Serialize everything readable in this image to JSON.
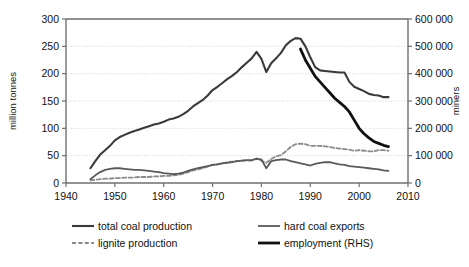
{
  "chart_data": {
    "type": "line",
    "title": "",
    "xlabel": "",
    "ylabel": "million tonnes",
    "y2label": "miners",
    "xlim": [
      1940,
      2010
    ],
    "ylim": [
      0,
      300
    ],
    "y2lim": [
      0,
      600000
    ],
    "xticks": [
      1940,
      1950,
      1960,
      1970,
      1980,
      1990,
      2000,
      2010
    ],
    "xticklabels": [
      "1940",
      "1950",
      "1960",
      "1970",
      "1980",
      "1990",
      "2000",
      "2010"
    ],
    "yticks": [
      0,
      50,
      100,
      150,
      200,
      250,
      300
    ],
    "yticklabels": [
      "0",
      "50",
      "100",
      "150",
      "200",
      "250",
      "300"
    ],
    "y2ticks": [
      0,
      100000,
      200000,
      300000,
      400000,
      500000,
      600000
    ],
    "y2ticklabels": [
      "0",
      "100 000",
      "200 000",
      "300 000",
      "400 000",
      "500 000",
      "600 000"
    ],
    "grid": true,
    "grid_axis": "y",
    "legend_position": "below",
    "series": [
      {
        "name": "total coal production",
        "axis": "left",
        "style": "solid",
        "color": "#3a3a3a",
        "width": 2.1,
        "x": [
          1945,
          1946,
          1947,
          1948,
          1949,
          1950,
          1951,
          1952,
          1953,
          1954,
          1955,
          1956,
          1957,
          1958,
          1959,
          1960,
          1961,
          1962,
          1963,
          1964,
          1965,
          1966,
          1967,
          1968,
          1969,
          1970,
          1971,
          1972,
          1973,
          1974,
          1975,
          1976,
          1977,
          1978,
          1979,
          1980,
          1981,
          1982,
          1983,
          1984,
          1985,
          1986,
          1987,
          1988,
          1989,
          1990,
          1991,
          1992,
          1993,
          1994,
          1995,
          1996,
          1997,
          1998,
          1999,
          2000,
          2001,
          2002,
          2003,
          2004,
          2005,
          2006
        ],
        "y": [
          27,
          40,
          52,
          60,
          68,
          78,
          84,
          88,
          92,
          95,
          98,
          101,
          104,
          107,
          109,
          112,
          116,
          118,
          121,
          126,
          132,
          140,
          146,
          152,
          160,
          170,
          176,
          183,
          190,
          196,
          203,
          212,
          220,
          228,
          240,
          227,
          203,
          219,
          228,
          238,
          252,
          260,
          265,
          264,
          250,
          230,
          212,
          206,
          205,
          204,
          203,
          202,
          202,
          185,
          176,
          172,
          168,
          163,
          161,
          160,
          157,
          157
        ]
      },
      {
        "name": "lignite production",
        "axis": "left",
        "style": "dashed",
        "color": "#8a8a8a",
        "width": 1.8,
        "x": [
          1945,
          1946,
          1947,
          1948,
          1949,
          1950,
          1951,
          1952,
          1953,
          1954,
          1955,
          1956,
          1957,
          1958,
          1959,
          1960,
          1961,
          1962,
          1963,
          1964,
          1965,
          1966,
          1967,
          1968,
          1969,
          1970,
          1971,
          1972,
          1973,
          1974,
          1975,
          1976,
          1977,
          1978,
          1979,
          1980,
          1981,
          1982,
          1983,
          1984,
          1985,
          1986,
          1987,
          1988,
          1989,
          1990,
          1991,
          1992,
          1993,
          1994,
          1995,
          1996,
          1997,
          1998,
          1999,
          2000,
          2001,
          2002,
          2003,
          2004,
          2005,
          2006
        ],
        "y": [
          5,
          6,
          7,
          8,
          8,
          9,
          9,
          10,
          10,
          10,
          11,
          11,
          11,
          12,
          12,
          13,
          13,
          14,
          15,
          17,
          20,
          23,
          25,
          27,
          30,
          33,
          34,
          36,
          38,
          39,
          40,
          41,
          41,
          41,
          45,
          41,
          37,
          44,
          49,
          51,
          58,
          66,
          71,
          72,
          71,
          68,
          68,
          68,
          67,
          66,
          64,
          63,
          62,
          61,
          59,
          60,
          59,
          58,
          58,
          60,
          60,
          59
        ]
      },
      {
        "name": "hard coal exports",
        "axis": "left",
        "style": "solid",
        "color": "#5a5a5a",
        "width": 1.8,
        "x": [
          1945,
          1946,
          1947,
          1948,
          1949,
          1950,
          1951,
          1952,
          1953,
          1954,
          1955,
          1956,
          1957,
          1958,
          1959,
          1960,
          1961,
          1962,
          1963,
          1964,
          1965,
          1966,
          1967,
          1968,
          1969,
          1970,
          1971,
          1972,
          1973,
          1974,
          1975,
          1976,
          1977,
          1978,
          1979,
          1980,
          1981,
          1982,
          1983,
          1984,
          1985,
          1986,
          1987,
          1988,
          1989,
          1990,
          1991,
          1992,
          1993,
          1994,
          1995,
          1996,
          1997,
          1998,
          1999,
          2000,
          2001,
          2002,
          2003,
          2004,
          2005,
          2006
        ],
        "y": [
          7,
          14,
          20,
          24,
          26,
          27,
          27,
          26,
          25,
          24,
          24,
          23,
          22,
          21,
          20,
          18,
          17,
          16,
          17,
          19,
          22,
          25,
          27,
          29,
          31,
          33,
          34,
          36,
          37,
          38,
          40,
          41,
          42,
          42,
          44,
          43,
          27,
          40,
          42,
          43,
          43,
          40,
          38,
          36,
          34,
          32,
          35,
          37,
          38,
          38,
          36,
          34,
          33,
          31,
          30,
          29,
          28,
          27,
          26,
          25,
          23,
          22
        ]
      },
      {
        "name": "employment (RHS)",
        "axis": "right",
        "style": "solid",
        "color": "#111111",
        "width": 2.8,
        "x": [
          1988,
          1989,
          1990,
          1991,
          1992,
          1993,
          1994,
          1995,
          1996,
          1997,
          1998,
          1999,
          2000,
          2001,
          2002,
          2003,
          2004,
          2005,
          2006
        ],
        "y": [
          490000,
          450000,
          420000,
          390000,
          370000,
          350000,
          330000,
          310000,
          295000,
          280000,
          260000,
          230000,
          200000,
          180000,
          165000,
          152000,
          145000,
          138000,
          133000
        ]
      }
    ]
  },
  "legend": {
    "entries": [
      {
        "label": "total coal production",
        "style": "solid",
        "color": "#3a3a3a",
        "width": 2.1
      },
      {
        "label": "lignite production",
        "style": "dashed",
        "color": "#8a8a8a",
        "width": 1.8
      },
      {
        "label": "hard coal exports",
        "style": "solid",
        "color": "#5a5a5a",
        "width": 1.8
      },
      {
        "label": "employment (RHS)",
        "style": "solid",
        "color": "#111111",
        "width": 2.8
      }
    ]
  }
}
